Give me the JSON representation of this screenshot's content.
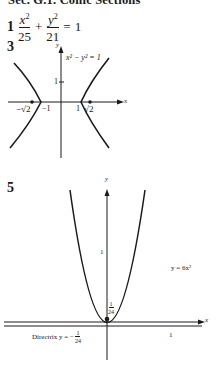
{
  "section_title": "Sec. G.1. Conic Sections",
  "problems": [
    {
      "number": "1",
      "equation": {
        "term1": {
          "numerator": "x",
          "numerator_exp": "2",
          "denominator": "25"
        },
        "operator": "+",
        "term2": {
          "numerator": "y",
          "numerator_exp": "2",
          "denominator": "21"
        },
        "equals": "=",
        "rhs": "1"
      }
    },
    {
      "number": "3",
      "graph": {
        "type": "hyperbola",
        "label": "x² − y² = 1",
        "x_axis_label": "x",
        "y_axis_label": "y",
        "y_tick": "1",
        "x_ticks": [
          "−√2",
          "−1",
          "1",
          "√2"
        ],
        "foci_labels": [
          "−√2",
          "√2"
        ]
      }
    },
    {
      "number": "5",
      "graph": {
        "type": "parabola",
        "label": "y = 6x²",
        "x_axis_label": "x",
        "y_axis_label": "y",
        "y_tick": "1",
        "x_tick": "1",
        "focus_label_num": "1",
        "focus_label_den": "24",
        "directrix_label": "Directrix y = −",
        "directrix_num": "1",
        "directrix_den": "24"
      }
    }
  ]
}
